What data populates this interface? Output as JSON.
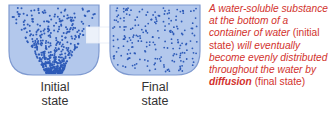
{
  "diagram": {
    "initial": {
      "label_line1": "Initial",
      "label_line2": "state"
    },
    "final": {
      "label_line1": "Final",
      "label_line2": "state"
    },
    "colors": {
      "water": "#b3c8ec",
      "border": "#7f9ad0",
      "particle": "#2e5bb8",
      "text": "#d2322d"
    },
    "description": {
      "p1": "A water-soluble substance at the bottom of a container of water ",
      "p2": "(initial state)",
      "p3": " will eventually become evenly distributed throughout the water by ",
      "p4": "diffusion",
      "p5": " (final state)"
    }
  }
}
